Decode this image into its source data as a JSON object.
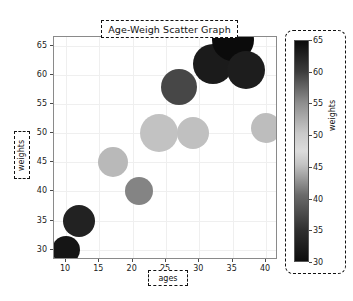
{
  "figure": {
    "background": "#ffffff",
    "axes_background": "#ffffff",
    "grid_color": "#efefef",
    "spine_color": "#8a8a8a"
  },
  "chart_data": {
    "type": "scatter",
    "title": "Age-Weigh Scatter Graph",
    "xlabel": "ages",
    "ylabel": "weights",
    "xlim": [
      8.2,
      41.8
    ],
    "ylim": [
      28.2,
      66.6
    ],
    "xticks": [
      10,
      15,
      20,
      25,
      30,
      35,
      40
    ],
    "yticks": [
      30,
      35,
      40,
      45,
      50,
      55,
      60,
      65
    ],
    "xticklabels": [
      "10",
      "15",
      "20",
      "25",
      "30",
      "35",
      "40"
    ],
    "yticklabels": [
      "30",
      "35",
      "40",
      "45",
      "50",
      "55",
      "60",
      "65"
    ],
    "grid": true,
    "legend": null,
    "x": [
      10,
      12,
      17,
      21,
      24,
      27,
      29,
      32,
      35,
      37,
      40
    ],
    "y": [
      30,
      35,
      45,
      40,
      50,
      58,
      50,
      62,
      66,
      61,
      51
    ],
    "sizes": [
      14,
      16,
      15,
      14,
      19,
      18,
      16,
      20,
      21,
      19,
      15
    ],
    "colors": [
      "#151515",
      "#222222",
      "#b9b9b9",
      "#848484",
      "#c2c2c2",
      "#474747",
      "#c0c0c0",
      "#1b1b1b",
      "#0b0b0b",
      "#1d1d1d",
      "#bdbdbd"
    ],
    "colorbar": {
      "label": "weights",
      "ticks": [
        30,
        35,
        40,
        45,
        50,
        55,
        60,
        65
      ],
      "ticklabels": [
        "30",
        "35",
        "40",
        "45",
        "50",
        "55",
        "60",
        "65"
      ],
      "vmin": 30,
      "vmax": 65,
      "orientation": "vertical",
      "gradient_stops": [
        {
          "pos": 0,
          "color": "#0d0d0d"
        },
        {
          "pos": 14,
          "color": "#2f2f2f"
        },
        {
          "pos": 30,
          "color": "#6a6a6a"
        },
        {
          "pos": 44,
          "color": "#c4c4c4"
        },
        {
          "pos": 50,
          "color": "#dcdcdc"
        },
        {
          "pos": 58,
          "color": "#c9c9c9"
        },
        {
          "pos": 72,
          "color": "#8d8d8d"
        },
        {
          "pos": 86,
          "color": "#3c3c3c"
        },
        {
          "pos": 100,
          "color": "#0a0a0a"
        }
      ]
    }
  }
}
